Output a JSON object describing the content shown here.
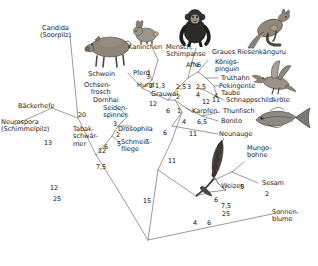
{
  "figure": {
    "type": "phylogenetic-tree",
    "language": "de"
  },
  "taxa": [
    {
      "id": "candida",
      "label": "Candida\n(Soorpilz)",
      "x": 40,
      "y": 25
    },
    {
      "id": "baeckerhefe",
      "label": "Bäckerhefe",
      "x": 18,
      "y": 103
    },
    {
      "id": "neurospora",
      "label": "Neurospora\n(Schimmelpilz)",
      "x": 1,
      "y": 119
    },
    {
      "id": "tabakschwaermer",
      "label": "Tabak-\nschwär-\nmer",
      "x": 73,
      "y": 126
    },
    {
      "id": "seidenspinner",
      "label": "Seiden-\nspinner",
      "x": 103,
      "y": 105
    },
    {
      "id": "drosophila",
      "label": "Drosophila",
      "x": 118,
      "y": 126
    },
    {
      "id": "schmeissfliege",
      "label": "Schmeiß-\nfliege",
      "x": 118,
      "y": 141
    },
    {
      "id": "schwein",
      "label": "Schwein",
      "x": 88,
      "y": 71
    },
    {
      "id": "kaninchen",
      "label": "Kaninchen",
      "x": 130,
      "y": 45
    },
    {
      "id": "pferd",
      "label": "Pferd",
      "x": 133,
      "y": 71
    },
    {
      "id": "hund",
      "label": "Hund",
      "x": 139,
      "y": 84
    },
    {
      "id": "ochsenfrosch",
      "label": "Ochsen-\nfrosch",
      "x": 84,
      "y": 83
    },
    {
      "id": "dornhai",
      "label": "Dornhai",
      "x": 93,
      "y": 98
    },
    {
      "id": "grauwal",
      "label": "Grauwal",
      "x": 153,
      "y": 93
    },
    {
      "id": "mensch",
      "label": "Mensch,\nSchimpanse",
      "x": 168,
      "y": 45
    },
    {
      "id": "affe",
      "label": "Affe",
      "x": 185,
      "y": 63
    },
    {
      "id": "kaenguru",
      "label": "Graues Riesenkänguru",
      "x": 213,
      "y": 50
    },
    {
      "id": "koenigspinguin",
      "label": "Königs-\npinguin",
      "x": 216,
      "y": 60
    },
    {
      "id": "truthahn",
      "label": "Truthahn",
      "x": 222,
      "y": 77
    },
    {
      "id": "pekingente",
      "label": "Pekingente",
      "x": 220,
      "y": 85
    },
    {
      "id": "taube",
      "label": "Taube",
      "x": 221,
      "y": 92
    },
    {
      "id": "schnappschildkroete",
      "label": "Schnappschildkröte",
      "x": 227,
      "y": 99
    },
    {
      "id": "karpfen",
      "label": "Karpfen",
      "x": 194,
      "y": 110
    },
    {
      "id": "thunfisch",
      "label": "Thunfisch",
      "x": 224,
      "y": 110
    },
    {
      "id": "bonito",
      "label": "Bonito",
      "x": 222,
      "y": 120
    },
    {
      "id": "neunauge",
      "label": "Neunauge",
      "x": 220,
      "y": 133
    },
    {
      "id": "mungobohne",
      "label": "Mungo-\nbohne",
      "x": 248,
      "y": 146
    },
    {
      "id": "weizen",
      "label": "Weizen",
      "x": 222,
      "y": 185
    },
    {
      "id": "sesam",
      "label": "Sesam",
      "x": 263,
      "y": 181
    },
    {
      "id": "sonnenblume",
      "label": "Sonnen-\nblume",
      "x": 273,
      "y": 211
    }
  ],
  "branch_numbers": [
    {
      "id": "n25a",
      "value": "25",
      "x": 53,
      "y": 196
    },
    {
      "id": "n13",
      "value": "13",
      "x": 44,
      "y": 140
    },
    {
      "id": "n20",
      "value": "20",
      "x": 78,
      "y": 112
    },
    {
      "id": "n12a",
      "value": "12",
      "x": 98,
      "y": 148
    },
    {
      "id": "n12b",
      "value": "12",
      "x": 50,
      "y": 185
    },
    {
      "id": "n3",
      "value": "3",
      "x": 113,
      "y": 121
    },
    {
      "id": "n2a",
      "value": "2",
      "x": 116,
      "y": 134
    },
    {
      "id": "n5",
      "value": "5",
      "x": 117,
      "y": 143
    },
    {
      "id": "n6a",
      "value": "6",
      "x": 104,
      "y": 144
    },
    {
      "id": "n75a",
      "value": "7,5",
      "x": 98,
      "y": 164
    },
    {
      "id": "n15",
      "value": "15",
      "x": 143,
      "y": 198
    },
    {
      "id": "n11a",
      "value": "11",
      "x": 168,
      "y": 158
    },
    {
      "id": "n25b",
      "value": "25",
      "x": 222,
      "y": 211
    },
    {
      "id": "n6b",
      "value": "6",
      "x": 197,
      "y": 64
    },
    {
      "id": "n3b",
      "value": "3",
      "x": 146,
      "y": 76
    },
    {
      "id": "n2_13",
      "value": "2",
      "x": 150,
      "y": 84
    },
    {
      "id": "n13b",
      "value": "1,3",
      "x": 156,
      "y": 84
    },
    {
      "id": "n25c",
      "value": "2,5",
      "x": 178,
      "y": 85
    },
    {
      "id": "n3c",
      "value": "3",
      "x": 187,
      "y": 85
    },
    {
      "id": "n25d",
      "value": "2,5",
      "x": 197,
      "y": 85
    },
    {
      "id": "n4a",
      "value": "4",
      "x": 196,
      "y": 94
    },
    {
      "id": "n2b",
      "value": "2",
      "x": 176,
      "y": 95
    },
    {
      "id": "n6c",
      "value": "6",
      "x": 167,
      "y": 109
    },
    {
      "id": "n1",
      "value": "1",
      "x": 177,
      "y": 109
    },
    {
      "id": "n12c",
      "value": "12",
      "x": 151,
      "y": 103
    },
    {
      "id": "n4b",
      "value": "4",
      "x": 182,
      "y": 120
    },
    {
      "id": "n65",
      "value": "6,5",
      "x": 198,
      "y": 120
    },
    {
      "id": "n6d",
      "value": "6",
      "x": 163,
      "y": 132
    },
    {
      "id": "n11b",
      "value": "11",
      "x": 190,
      "y": 133
    },
    {
      "id": "n12d",
      "value": "12",
      "x": 203,
      "y": 101
    },
    {
      "id": "n4c",
      "value": "4",
      "x": 215,
      "y": 95
    },
    {
      "id": "n11c",
      "value": "11",
      "x": 213,
      "y": 98
    },
    {
      "id": "n5b",
      "value": "5",
      "x": 240,
      "y": 184
    },
    {
      "id": "n2c",
      "value": "2",
      "x": 265,
      "y": 192
    },
    {
      "id": "n6e",
      "value": "6",
      "x": 214,
      "y": 197
    },
    {
      "id": "n75b",
      "value": "7,5",
      "x": 222,
      "y": 203
    },
    {
      "id": "n4d",
      "value": "4",
      "x": 193,
      "y": 221
    },
    {
      "id": "n6f",
      "value": "6",
      "x": 207,
      "y": 221
    }
  ],
  "illustrations": [
    {
      "id": "pig",
      "name": "pig-illustration",
      "x": 85,
      "y": 30,
      "w": 48,
      "h": 38
    },
    {
      "id": "rabbit",
      "name": "rabbit-illustration",
      "x": 131,
      "y": 20,
      "w": 27,
      "h": 24
    },
    {
      "id": "chimp",
      "name": "chimpanzee-illustration",
      "x": 176,
      "y": 8,
      "w": 38,
      "h": 38
    },
    {
      "id": "kangaroo",
      "name": "kangaroo-illustration",
      "x": 248,
      "y": 8,
      "w": 48,
      "h": 42
    },
    {
      "id": "duck",
      "name": "duck-illustration",
      "x": 252,
      "y": 58,
      "w": 44,
      "h": 38
    },
    {
      "id": "tuna",
      "name": "tuna-illustration",
      "x": 252,
      "y": 106,
      "w": 58,
      "h": 28
    },
    {
      "id": "wheat",
      "name": "wheat-illustration",
      "x": 195,
      "y": 140,
      "w": 38,
      "h": 60
    }
  ],
  "colors": {
    "line": "#6e6e6e",
    "text": "#1a1a1a",
    "background": "#ffffff"
  }
}
